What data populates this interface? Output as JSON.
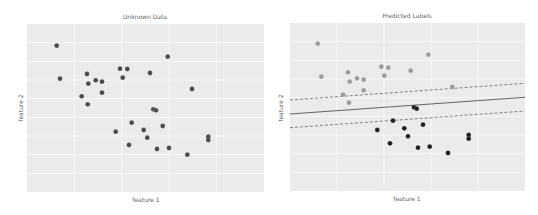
{
  "chart_data": [
    {
      "type": "scatter",
      "title": "Unknown Data",
      "xlabel": "feature 1",
      "ylabel": "feature 2",
      "grid": true,
      "legend": null,
      "plot_area_px": {
        "left": 27,
        "top": 24,
        "right": 264,
        "bottom": 192
      },
      "series": [
        {
          "name": "unlabeled",
          "color": "#4a4a4a",
          "points_px": [
            [
              56.7,
              45.7
            ],
            [
              167.7,
              56.7
            ],
            [
              60,
              78.7
            ],
            [
              87,
              74
            ],
            [
              120,
              68.7
            ],
            [
              127.3,
              69
            ],
            [
              150,
              73
            ],
            [
              88.3,
              83.7
            ],
            [
              95.7,
              80.3
            ],
            [
              102,
              81.7
            ],
            [
              122.7,
              77.7
            ],
            [
              192,
              89
            ],
            [
              102,
              92.7
            ],
            [
              81.7,
              96.3
            ],
            [
              87.7,
              104.3
            ],
            [
              153.3,
              109.3
            ],
            [
              156,
              110.3
            ],
            [
              131.7,
              122.7
            ],
            [
              162.7,
              126
            ],
            [
              115.7,
              131.7
            ],
            [
              143.7,
              130
            ],
            [
              147.3,
              137.7
            ],
            [
              208.3,
              136.7
            ],
            [
              208.3,
              140
            ],
            [
              129,
              145
            ],
            [
              157,
              149
            ],
            [
              169,
              148
            ],
            [
              187.3,
              154.7
            ]
          ]
        }
      ]
    },
    {
      "type": "scatter",
      "title": "Predicted Labels",
      "xlabel": "feature 1",
      "ylabel": "feature 2",
      "grid": true,
      "legend": null,
      "plot_area_px": {
        "left": 290,
        "top": 23,
        "right": 525,
        "bottom": 191
      },
      "series": [
        {
          "name": "class 0",
          "color": "#9a9a9a",
          "points_px": [
            [
              317.7,
              43.7
            ],
            [
              428.3,
              54.7
            ],
            [
              321.3,
              76.7
            ],
            [
              348,
              72.3
            ],
            [
              381.3,
              66.7
            ],
            [
              388.3,
              67.7
            ],
            [
              410.7,
              70.7
            ],
            [
              349.7,
              81.7
            ],
            [
              357,
              78.3
            ],
            [
              363.7,
              79.7
            ],
            [
              384.3,
              75.7
            ],
            [
              452.3,
              87
            ],
            [
              363.7,
              90.3
            ],
            [
              343,
              94.7
            ],
            [
              349,
              102.7
            ]
          ]
        },
        {
          "name": "class 1",
          "color": "#1e1e1e",
          "points_px": [
            [
              414,
              107.3
            ],
            [
              416.7,
              108.7
            ],
            [
              393,
              120.7
            ],
            [
              423,
              124.7
            ],
            [
              377.3,
              130
            ],
            [
              404.3,
              128.3
            ],
            [
              408,
              136.3
            ],
            [
              468.7,
              135
            ],
            [
              468.7,
              138.7
            ],
            [
              390,
              143.3
            ],
            [
              418,
              147.7
            ],
            [
              429.7,
              146.7
            ],
            [
              448,
              153
            ]
          ]
        }
      ],
      "lines": [
        {
          "name": "decision boundary",
          "style": "solid",
          "color": "#555555",
          "from_px": [
            290,
            114
          ],
          "to_px": [
            525,
            97.3
          ]
        },
        {
          "name": "margin upper",
          "style": "dashed",
          "color": "#777777",
          "from_px": [
            290,
            100
          ],
          "to_px": [
            525,
            83.3
          ]
        },
        {
          "name": "margin lower",
          "style": "dashed",
          "color": "#777777",
          "from_px": [
            290,
            127.7
          ],
          "to_px": [
            525,
            111
          ]
        }
      ]
    }
  ],
  "left": {
    "title": "Unknown Data",
    "xlabel": "feature 1",
    "ylabel": "feature 2"
  },
  "right": {
    "title": "Predicted Labels",
    "xlabel": "feature 1",
    "ylabel": "feature 2"
  },
  "colors": {
    "plot_bg": "#ebebeb",
    "grid": "#f7f7f7",
    "point_dark": "#3a3a3a",
    "point_grey": "#9a9a9a"
  }
}
